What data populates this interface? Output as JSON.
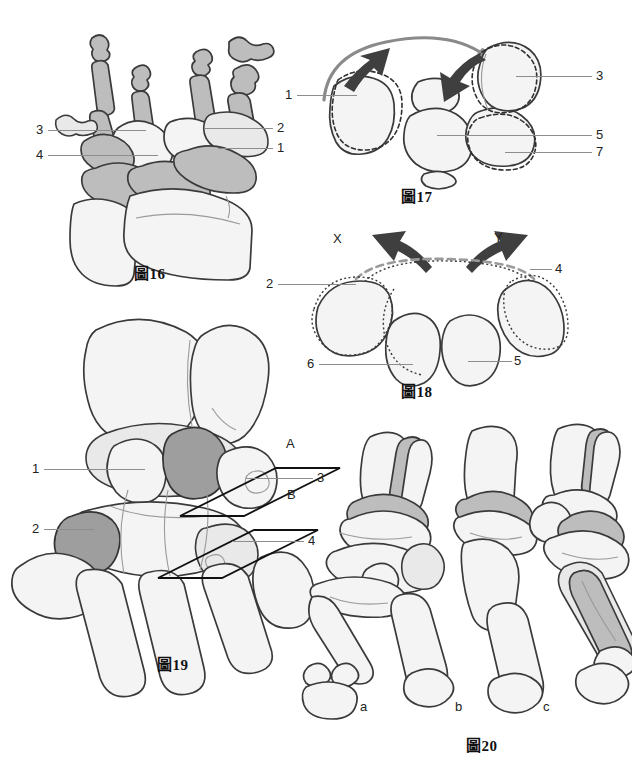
{
  "page": {
    "language": "zh-Hant",
    "background": "#ffffff"
  },
  "figures": [
    {
      "id": "fig16",
      "caption": "圖16",
      "description": "Dorsal view of hand skeleton with shaded carpal bones",
      "labels": [
        {
          "text": "3",
          "side": "left",
          "x": 36,
          "y": 130
        },
        {
          "text": "4",
          "side": "left",
          "x": 36,
          "y": 155
        },
        {
          "text": "2",
          "side": "right",
          "x": 277,
          "y": 128
        },
        {
          "text": "1",
          "side": "right",
          "x": 277,
          "y": 148
        }
      ]
    },
    {
      "id": "fig17",
      "caption": "圖17",
      "description": "Proximal transverse section of carpus with rotation arrows",
      "labels": [
        {
          "text": "1",
          "side": "left",
          "x": 285,
          "y": 95
        },
        {
          "text": "3",
          "side": "right",
          "x": 596,
          "y": 76
        },
        {
          "text": "5",
          "side": "right",
          "x": 596,
          "y": 135
        },
        {
          "text": "7",
          "side": "right",
          "x": 596,
          "y": 152
        }
      ]
    },
    {
      "id": "fig18",
      "caption": "圖18",
      "description": "Distal transverse section of carpus with divergent arrows X and Y",
      "labels": [
        {
          "text": "X",
          "side": "free",
          "x": 336,
          "y": 238
        },
        {
          "text": "Y",
          "side": "free",
          "x": 497,
          "y": 237
        },
        {
          "text": "2",
          "side": "left",
          "x": 269,
          "y": 284
        },
        {
          "text": "4",
          "side": "right",
          "x": 557,
          "y": 269
        },
        {
          "text": "6",
          "side": "left",
          "x": 310,
          "y": 364
        },
        {
          "text": "5",
          "side": "right",
          "x": 516,
          "y": 361
        }
      ]
    },
    {
      "id": "fig19",
      "caption": "圖19",
      "description": "Oblique view of carpus with two sectional planes A and B",
      "labels": [
        {
          "text": "1",
          "side": "left",
          "x": 32,
          "y": 469
        },
        {
          "text": "2",
          "side": "left",
          "x": 32,
          "y": 529
        },
        {
          "text": "A",
          "side": "plane",
          "x": 289,
          "y": 444
        },
        {
          "text": "3",
          "side": "right",
          "x": 319,
          "y": 478
        },
        {
          "text": "B",
          "side": "plane",
          "x": 290,
          "y": 495
        },
        {
          "text": "4",
          "side": "right",
          "x": 310,
          "y": 541
        }
      ]
    },
    {
      "id": "fig20",
      "caption": "圖20",
      "description": "Three lateral views of the thumb ray column a, b and c",
      "labels": [
        {
          "text": "a",
          "side": "below",
          "x": 362,
          "y": 707
        },
        {
          "text": "b",
          "side": "below",
          "x": 457,
          "y": 707
        },
        {
          "text": "c",
          "side": "below",
          "x": 545,
          "y": 707
        }
      ]
    }
  ],
  "captions": {
    "fig16": {
      "text": "圖16",
      "x": 134,
      "y": 272
    },
    "fig17": {
      "text": "圖17",
      "x": 401,
      "y": 193
    },
    "fig18": {
      "text": "圖18",
      "x": 401,
      "y": 388
    },
    "fig19": {
      "text": "圖19",
      "x": 157,
      "y": 661
    },
    "fig20": {
      "text": "圖20",
      "x": 466,
      "y": 742
    }
  },
  "colors": {
    "outline": "#3a3a3a",
    "bone_fill": "#f4f4f4",
    "shade_light": "#bdbdbd",
    "shade_dark": "#9e9e9e",
    "leader": "#8d8d8d",
    "arrow_dark": "#3f3f3f",
    "arrow_grey": "#8a8a8a",
    "text": "#222222"
  }
}
